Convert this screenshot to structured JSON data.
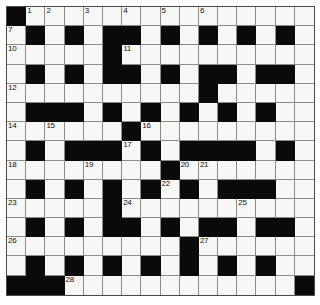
{
  "puzzle": {
    "title": "Crossword Grid",
    "columns": 16,
    "rows": 15,
    "cell_size_px": 19.2,
    "colors": {
      "block": "#0a0a0a",
      "open": "#f7f7f5",
      "gridline": "#8c8c8c",
      "border": "#4a4a4a",
      "number_text": "#101010",
      "page_background": "#ffffff"
    },
    "clue_numbers": [
      {
        "number": "1",
        "row": 0,
        "col": 1
      },
      {
        "number": "2",
        "row": 0,
        "col": 2
      },
      {
        "number": "3",
        "row": 0,
        "col": 4
      },
      {
        "number": "4",
        "row": 0,
        "col": 6
      },
      {
        "number": "5",
        "row": 0,
        "col": 8
      },
      {
        "number": "6",
        "row": 0,
        "col": 10
      },
      {
        "number": "7",
        "row": 1,
        "col": 0
      },
      {
        "number": "8",
        "row": 1,
        "col": 12
      },
      {
        "number": "9",
        "row": 1,
        "col": 14
      },
      {
        "number": "10",
        "row": 2,
        "col": 0
      },
      {
        "number": "11",
        "row": 2,
        "col": 6
      },
      {
        "number": "12",
        "row": 4,
        "col": 0
      },
      {
        "number": "13",
        "row": 4,
        "col": 10
      },
      {
        "number": "14",
        "row": 6,
        "col": 0
      },
      {
        "number": "15",
        "row": 6,
        "col": 2
      },
      {
        "number": "16",
        "row": 6,
        "col": 7
      },
      {
        "number": "17",
        "row": 7,
        "col": 6
      },
      {
        "number": "18",
        "row": 8,
        "col": 0
      },
      {
        "number": "19",
        "row": 8,
        "col": 4
      },
      {
        "number": "20",
        "row": 8,
        "col": 9
      },
      {
        "number": "21",
        "row": 8,
        "col": 10
      },
      {
        "number": "22",
        "row": 9,
        "col": 8
      },
      {
        "number": "23",
        "row": 10,
        "col": 0
      },
      {
        "number": "24",
        "row": 10,
        "col": 6
      },
      {
        "number": "25",
        "row": 10,
        "col": 12
      },
      {
        "number": "26",
        "row": 12,
        "col": 0
      },
      {
        "number": "27",
        "row": 12,
        "col": 10
      },
      {
        "number": "28",
        "row": 14,
        "col": 3
      }
    ],
    "grid": [
      "X...............",
      ".X.X.XX.X.X.X.X.",
      ".....X..........",
      ".X.X.XX.X.XX.XX.",
      "..........X.....",
      ".XXX.X.X.X.X.X..",
      "......X.........",
      ".X.XXX.X.XXXX.X.",
      "........X.......",
      ".X.X.X.X.X.XXX..",
      ".....X..........",
      ".X.X.XX.X.XX.XX.",
      ".........X......",
      ".X.X.X.X.X.X.X..",
      "XXX............X"
    ],
    "legend": {
      "open_char": ".",
      "block_char": "X"
    }
  }
}
